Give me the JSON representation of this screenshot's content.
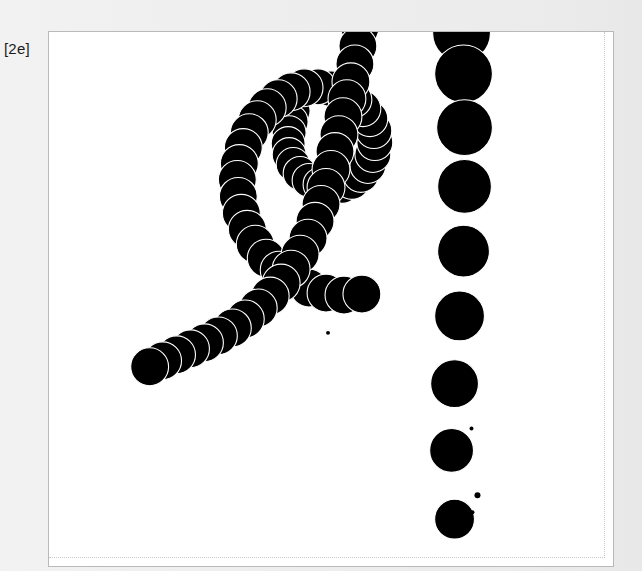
{
  "figure": {
    "label": "[2e]",
    "background_color": "#ededed",
    "plot_background_color": "#ffffff",
    "frame_color": "#b9b9b9",
    "inner_guide_color": "#c9c9c9"
  },
  "chart_data": {
    "type": "scatter",
    "title": "",
    "subtitle": "",
    "xlabel": "",
    "ylabel": "",
    "xlim": [
      0,
      566
    ],
    "ylim": [
      0,
      536
    ],
    "grid": false,
    "legend": null,
    "marker_shape": "circle",
    "marker_fill": "#000000",
    "marker_edge": "#ffffff",
    "annotations": [
      "[2e]"
    ],
    "series": [
      {
        "name": "spiral-arm",
        "marker_size_range": [
          26,
          38
        ],
        "points": [
          {
            "x": 245,
            "y": 79,
            "r": 17
          },
          {
            "x": 243,
            "y": 90,
            "r": 17
          },
          {
            "x": 241,
            "y": 101,
            "r": 17
          },
          {
            "x": 240,
            "y": 112,
            "r": 17
          },
          {
            "x": 241,
            "y": 123,
            "r": 17
          },
          {
            "x": 245,
            "y": 133,
            "r": 17
          },
          {
            "x": 252,
            "y": 142,
            "r": 17
          },
          {
            "x": 261,
            "y": 149,
            "r": 17
          },
          {
            "x": 272,
            "y": 153,
            "r": 17
          },
          {
            "x": 283,
            "y": 155,
            "r": 17
          },
          {
            "x": 294,
            "y": 154,
            "r": 18
          },
          {
            "x": 304,
            "y": 150,
            "r": 18
          },
          {
            "x": 313,
            "y": 143,
            "r": 18
          },
          {
            "x": 320,
            "y": 134,
            "r": 18
          },
          {
            "x": 325,
            "y": 123,
            "r": 18
          },
          {
            "x": 327,
            "y": 111,
            "r": 18
          },
          {
            "x": 326,
            "y": 99,
            "r": 18
          },
          {
            "x": 322,
            "y": 87,
            "r": 18
          },
          {
            "x": 315,
            "y": 77,
            "r": 18
          },
          {
            "x": 306,
            "y": 68,
            "r": 18
          },
          {
            "x": 295,
            "y": 61,
            "r": 18
          },
          {
            "x": 283,
            "y": 57,
            "r": 18
          },
          {
            "x": 270,
            "y": 55,
            "r": 18
          },
          {
            "x": 256,
            "y": 56,
            "r": 19
          },
          {
            "x": 243,
            "y": 60,
            "r": 19
          },
          {
            "x": 230,
            "y": 67,
            "r": 19
          },
          {
            "x": 219,
            "y": 76,
            "r": 19
          },
          {
            "x": 209,
            "y": 88,
            "r": 19
          },
          {
            "x": 201,
            "y": 101,
            "r": 19
          },
          {
            "x": 195,
            "y": 116,
            "r": 19
          },
          {
            "x": 191,
            "y": 132,
            "r": 19
          },
          {
            "x": 189,
            "y": 148,
            "r": 19
          },
          {
            "x": 190,
            "y": 165,
            "r": 19
          },
          {
            "x": 193,
            "y": 182,
            "r": 19
          },
          {
            "x": 199,
            "y": 198,
            "r": 19
          },
          {
            "x": 207,
            "y": 213,
            "r": 19
          },
          {
            "x": 218,
            "y": 227,
            "r": 19
          },
          {
            "x": 231,
            "y": 239,
            "r": 19
          },
          {
            "x": 245,
            "y": 249,
            "r": 19
          },
          {
            "x": 261,
            "y": 257,
            "r": 19
          },
          {
            "x": 278,
            "y": 262,
            "r": 19
          },
          {
            "x": 296,
            "y": 264,
            "r": 19
          },
          {
            "x": 314,
            "y": 263,
            "r": 19
          }
        ]
      },
      {
        "name": "descending-strand",
        "marker_size_range": [
          30,
          40
        ],
        "points": [
          {
            "x": 312,
            "y": -4,
            "r": 19
          },
          {
            "x": 310,
            "y": 14,
            "r": 19
          },
          {
            "x": 307,
            "y": 32,
            "r": 19
          },
          {
            "x": 303,
            "y": 50,
            "r": 19
          },
          {
            "x": 299,
            "y": 67,
            "r": 19
          },
          {
            "x": 295,
            "y": 85,
            "r": 19
          },
          {
            "x": 291,
            "y": 103,
            "r": 19
          },
          {
            "x": 287,
            "y": 120,
            "r": 19
          },
          {
            "x": 283,
            "y": 138,
            "r": 19
          },
          {
            "x": 278,
            "y": 156,
            "r": 19
          },
          {
            "x": 273,
            "y": 173,
            "r": 19
          },
          {
            "x": 267,
            "y": 190,
            "r": 19
          },
          {
            "x": 260,
            "y": 207,
            "r": 19
          },
          {
            "x": 252,
            "y": 223,
            "r": 19
          },
          {
            "x": 243,
            "y": 238,
            "r": 19
          },
          {
            "x": 233,
            "y": 252,
            "r": 19
          },
          {
            "x": 222,
            "y": 265,
            "r": 19
          },
          {
            "x": 210,
            "y": 277,
            "r": 19
          },
          {
            "x": 197,
            "y": 288,
            "r": 19
          },
          {
            "x": 184,
            "y": 297,
            "r": 19
          },
          {
            "x": 170,
            "y": 305,
            "r": 19
          },
          {
            "x": 156,
            "y": 312,
            "r": 19
          },
          {
            "x": 142,
            "y": 318,
            "r": 19
          },
          {
            "x": 128,
            "y": 324,
            "r": 19
          },
          {
            "x": 114,
            "y": 330,
            "r": 19
          },
          {
            "x": 101,
            "y": 336,
            "r": 19
          }
        ]
      },
      {
        "name": "size-ramp-column",
        "marker_size_range": [
          38,
          58
        ],
        "points": [
          {
            "x": 414,
            "y": 1,
            "r": 29
          },
          {
            "x": 416,
            "y": 42,
            "r": 29
          },
          {
            "x": 417,
            "y": 96,
            "r": 28
          },
          {
            "x": 417,
            "y": 155,
            "r": 27
          },
          {
            "x": 416,
            "y": 220,
            "r": 26
          },
          {
            "x": 412,
            "y": 285,
            "r": 25
          },
          {
            "x": 407,
            "y": 353,
            "r": 24
          },
          {
            "x": 404,
            "y": 420,
            "r": 22
          },
          {
            "x": 407,
            "y": 489,
            "r": 20
          }
        ]
      },
      {
        "name": "speckles",
        "marker_size_range": [
          2,
          5
        ],
        "points": [
          {
            "x": 424,
            "y": 398,
            "r": 2
          },
          {
            "x": 430,
            "y": 465,
            "r": 3
          },
          {
            "x": 425,
            "y": 482,
            "r": 2
          },
          {
            "x": 280,
            "y": 302,
            "r": 2
          }
        ]
      }
    ]
  }
}
